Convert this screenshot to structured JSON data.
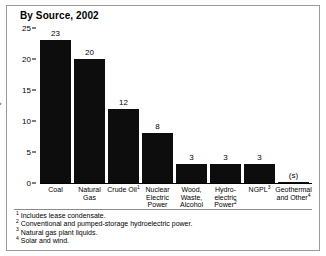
{
  "chart_data": {
    "type": "bar",
    "title": "By Source, 2002",
    "xlabel": "",
    "ylabel": "Quadrillion Btu",
    "ylim": [
      0,
      25
    ],
    "yticks": [
      0,
      5,
      10,
      15,
      20,
      25
    ],
    "grid": false,
    "legend": null,
    "categories": [
      "Coal",
      "Natural Gas",
      "Crude Oil",
      "Nuclear Electric Power",
      "Wood, Waste, Alcohol",
      "Hydro-electric Power",
      "NGPL",
      "Geothermal and Other"
    ],
    "category_lines": [
      [
        "Coal"
      ],
      [
        "Natural",
        "Gas"
      ],
      [
        "Crude Oil"
      ],
      [
        "Nuclear",
        "Electric",
        "Power"
      ],
      [
        "Wood,",
        "Waste,",
        "Alcohol"
      ],
      [
        "Hydro-",
        "electric",
        "Power"
      ],
      [
        "NGPL"
      ],
      [
        "Geothermal",
        "and Other"
      ]
    ],
    "category_footnote_markers": [
      "",
      "",
      "1",
      "",
      "",
      "2",
      "3",
      "4"
    ],
    "values": [
      23,
      20,
      12,
      8,
      3,
      3,
      3,
      0.15
    ],
    "data_labels": [
      "23",
      "20",
      "12",
      "8",
      "3",
      "3",
      "3",
      "(s)"
    ],
    "bar_color": "#0d0d0d"
  },
  "footnotes": [
    {
      "marker": "1",
      "text": "Includes lease condensate."
    },
    {
      "marker": "2",
      "text": "Conventional and pumped-storage hydroelectric power."
    },
    {
      "marker": "3",
      "text": "Natural gas plant liquids."
    },
    {
      "marker": "4",
      "text": "Solar and wind."
    }
  ]
}
